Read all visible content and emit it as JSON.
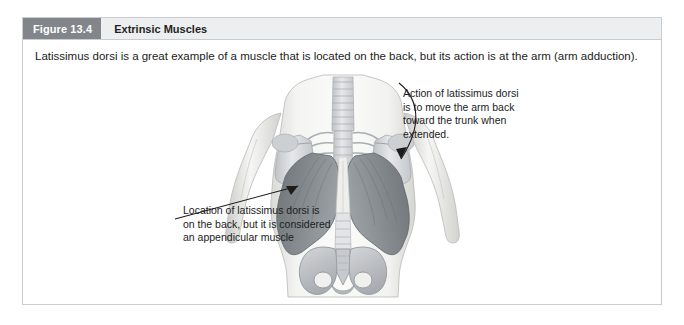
{
  "figure": {
    "number_label": "Figure 13.4",
    "title": "Extrinsic Muscles",
    "caption": "Latissimus dorsi is a great example of a muscle that is located on the back, but its action is at the arm (arm adduction)."
  },
  "annotations": {
    "action": "Action of latissimus dorsi is to move the arm back toward the trunk when extended.",
    "location": "Location of latissimus dorsi is on the back, but it is considered an appendicular muscle"
  },
  "illustration": {
    "alt": "posterior-torso-latissimus-dorsi-diagram"
  },
  "colors": {
    "figure_number_bg": "#82868b",
    "header_bg": "#eceef0",
    "border": "#c9ccd1",
    "muscle_fill": "#7f8489",
    "bone_fill": "#d8dade",
    "skin_fill": "#f1f1ef",
    "text": "#1c1c1c"
  }
}
